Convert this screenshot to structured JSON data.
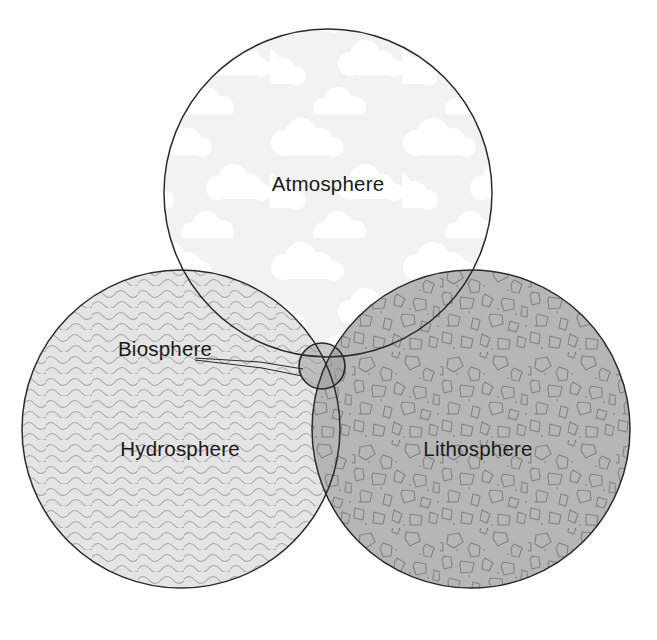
{
  "diagram": {
    "background_color": "#ffffff",
    "outline_color": "#2b2b2b",
    "label_color": "#1a1a1a",
    "spheres": [
      {
        "key": "atmosphere",
        "label": "Atmosphere",
        "fill_color": "#f2f2f2",
        "pattern": "clouds",
        "pattern_color": "#ffffff",
        "cx": 328,
        "cy": 193,
        "r": 164,
        "label_x": 328,
        "label_y": 191
      },
      {
        "key": "hydrosphere",
        "label": "Hydrosphere",
        "fill_color": "#e4e4e4",
        "pattern": "waves",
        "pattern_color": "#a8a8a8",
        "cx": 181,
        "cy": 429,
        "r": 159,
        "label_x": 180,
        "label_y": 456
      },
      {
        "key": "lithosphere",
        "label": "Lithosphere",
        "fill_color": "#b6b6b6",
        "pattern": "rocks",
        "pattern_color": "#8a8a8a",
        "cx": 471,
        "cy": 429,
        "r": 159,
        "label_x": 478,
        "label_y": 456
      }
    ],
    "biosphere": {
      "key": "biosphere",
      "label": "Biosphere",
      "fill_color": "#9e9e9e",
      "cx": 322,
      "cy": 366,
      "r": 23,
      "label_x": 118,
      "label_y": 355,
      "leader_from_x": 195,
      "leader_from_y": 360,
      "leader_to_x": 302,
      "leader_to_y": 372
    }
  }
}
